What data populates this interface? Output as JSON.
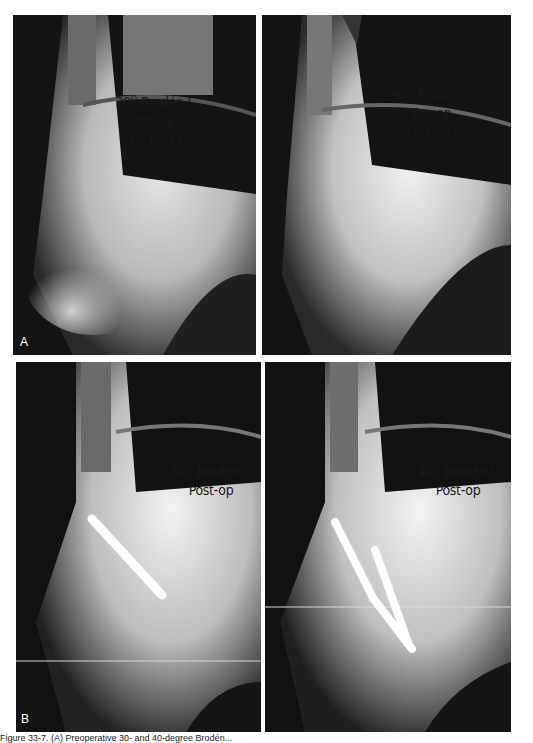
{
  "figure": {
    "caption": "Figure 33-7. (A) Preoperative 30- and 40-degree Brodén...",
    "row_a_label": "A",
    "row_b_label": "B",
    "panels": [
      {
        "id": "a-left",
        "angle": "30",
        "degree_symbol": "O",
        "view": "Brodén I.",
        "phase": "Pre-op",
        "date": "12-12-77"
      },
      {
        "id": "a-right",
        "angle": "40",
        "degree_symbol": "O",
        "view": "Brodén I.",
        "phase": "Pre-op",
        "date": "12-12-77"
      },
      {
        "id": "b-left",
        "angle": "30",
        "degree_symbol": "O",
        "view": "Brodén I.",
        "phase": "Post-op"
      },
      {
        "id": "b-right",
        "angle": "40",
        "degree_symbol": "O",
        "view": "Brodén I.",
        "phase": "Post-op"
      }
    ]
  }
}
